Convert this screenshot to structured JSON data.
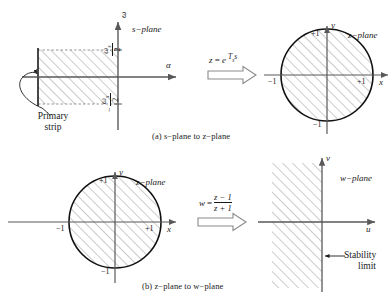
{
  "figure": {
    "panels": [
      {
        "id": "a",
        "caption": "(a) s−plane to z−plane",
        "left": {
          "plane_label": "s−plane",
          "axis_vertical": "ω",
          "axis_horizontal": "α",
          "tick_upper": "ω",
          "tick_upper_sub": "s",
          "tick_upper_den": "2",
          "tick_lower_sign": "−",
          "tick_lower": "ω",
          "tick_lower_sub": "s",
          "tick_lower_den": "2",
          "annotation_line1": "Primary",
          "annotation_line2": "strip",
          "region": "hatched primary strip in left half plane"
        },
        "transform": {
          "formula_lhs": "z",
          "formula_eq": "=",
          "formula_base": "e",
          "formula_exp": "T",
          "formula_exp_sub": "s",
          "formula_exp_tail": "s"
        },
        "right": {
          "plane_label": "z−plane",
          "axis_vertical": "y",
          "axis_horizontal": "x",
          "tick_top": "+1",
          "tick_bottom": "−1",
          "tick_left": "−1",
          "tick_right": "+1",
          "region": "hatched unit circle"
        }
      },
      {
        "id": "b",
        "caption": "(b) z−plane to w−plane",
        "left": {
          "plane_label": "z−plane",
          "axis_vertical": "y",
          "axis_horizontal": "x",
          "tick_top": "+1",
          "tick_bottom": "−1",
          "tick_left": "−1",
          "tick_right": "+1",
          "region": "hatched unit circle"
        },
        "transform": {
          "formula_lhs": "w",
          "formula_eq": "=",
          "formula_num": "z − 1",
          "formula_den": "z + 1"
        },
        "right": {
          "plane_label": "w−plane",
          "axis_vertical": "v",
          "axis_horizontal": "u",
          "annotation_line1": "Stability",
          "annotation_line2": "limit",
          "region": "hatched left half plane"
        }
      }
    ],
    "colors": {
      "ink": "#1a1a1a",
      "axis": "#595959",
      "hatch": "#8c8c8c",
      "outline": "#111111",
      "background": "#ffffff"
    }
  }
}
